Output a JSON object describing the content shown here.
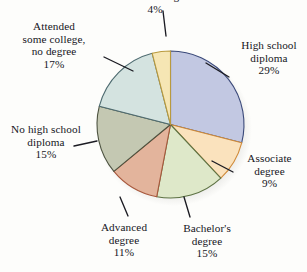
{
  "chart_data": {
    "type": "pie",
    "title": "",
    "subtitle": "",
    "xlabel": "",
    "ylabel": "",
    "legend_position": "labels-with-leader-lines",
    "grid": false,
    "total": 100,
    "start_angle_deg": 0,
    "direction": "clockwise",
    "categories": [
      "High school diploma",
      "Associate degree",
      "Bachelor's degree",
      "Advanced degree",
      "No high school diploma",
      "Attended some college, no degree",
      "advanced degree"
    ],
    "values": [
      29,
      9,
      15,
      11,
      15,
      17,
      4
    ],
    "colors": [
      "#c2c8e2",
      "#fae2bd",
      "#dee8c9",
      "#e3b49c",
      "#c4c8b2",
      "#d4e3e0",
      "#f6e6b4"
    ],
    "stroke_colors": [
      "#3b4a7a",
      "#d08a38",
      "#5d7243",
      "#a8583c",
      "#4d5340",
      "#4e6b70",
      "#b99a3e"
    ],
    "slices": [
      {
        "label_lines": [
          "High school",
          "diploma"
        ],
        "percent_text": "29%",
        "value": 29,
        "color": "#c2c8e2",
        "stroke": "#3b4a7a"
      },
      {
        "label_lines": [
          "Associate",
          "degree"
        ],
        "percent_text": "9%",
        "value": 9,
        "color": "#fae2bd",
        "stroke": "#d08a38"
      },
      {
        "label_lines": [
          "Bachelor's",
          "degree"
        ],
        "percent_text": "15%",
        "value": 15,
        "color": "#dee8c9",
        "stroke": "#5d7243"
      },
      {
        "label_lines": [
          "Advanced",
          "degree"
        ],
        "percent_text": "11%",
        "value": 11,
        "color": "#e3b49c",
        "stroke": "#a8583c"
      },
      {
        "label_lines": [
          "No high school",
          "diploma"
        ],
        "percent_text": "15%",
        "value": 15,
        "color": "#c4c8b2",
        "stroke": "#4d5340"
      },
      {
        "label_lines": [
          "Attended",
          "some college,",
          "no degree"
        ],
        "percent_text": "17%",
        "value": 17,
        "color": "#d4e3e0",
        "stroke": "#4e6b70"
      },
      {
        "label_lines": [
          "advanced degree"
        ],
        "percent_text": "4%",
        "value": 4,
        "color": "#f6e6b4",
        "stroke": "#b99a3e",
        "note": "label clipped at top edge of image"
      }
    ]
  },
  "labels": {
    "top": {
      "line1": "advanced degree",
      "percent": "4%"
    },
    "college": {
      "line1": "Attended",
      "line2": "some college,",
      "line3": "no degree",
      "percent": "17%"
    },
    "high_school": {
      "line1": "High school",
      "line2": "diploma",
      "percent": "29%"
    },
    "associate": {
      "line1": "Associate",
      "line2": "degree",
      "percent": "9%"
    },
    "bachelors": {
      "line1": "Bachelor's",
      "line2": "degree",
      "percent": "15%"
    },
    "advanced": {
      "line1": "Advanced",
      "line2": "degree",
      "percent": "11%"
    },
    "no_high_school": {
      "line1": "No high school",
      "line2": "diploma",
      "percent": "15%"
    }
  },
  "style": {
    "background": "#fdfdfb",
    "text_color": "#15151c",
    "leader_line_color": "#1b1b22"
  }
}
